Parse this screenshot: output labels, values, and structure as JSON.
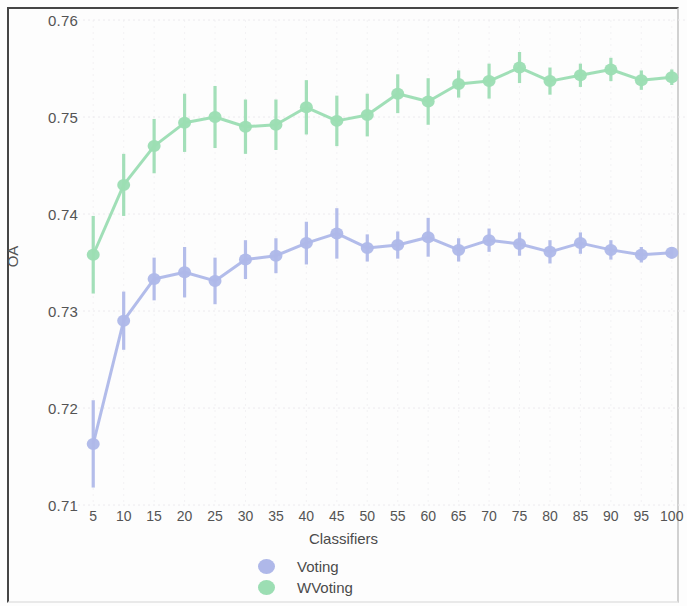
{
  "chart_data": {
    "type": "line",
    "title": "",
    "xlabel": "Classifiers",
    "ylabel": "OA",
    "x": [
      5,
      10,
      15,
      20,
      25,
      30,
      35,
      40,
      45,
      50,
      55,
      60,
      65,
      70,
      75,
      80,
      85,
      90,
      95,
      100
    ],
    "xtick_labels": [
      "5",
      "10",
      "15",
      "20",
      "25",
      "30",
      "35",
      "40",
      "45",
      "50",
      "55",
      "60",
      "65",
      "70",
      "75",
      "80",
      "85",
      "90",
      "95",
      "100"
    ],
    "ytick_labels": [
      "0.76",
      "0.75",
      "0.74",
      "0.73",
      "0.72",
      "0.71"
    ],
    "yticks": [
      0.76,
      0.75,
      0.74,
      0.73,
      0.72,
      0.71
    ],
    "xlim": [
      2.5,
      102.5
    ],
    "ylim": [
      0.71,
      0.76
    ],
    "grid": true,
    "legend_position": "bottom-center",
    "error_bars": true,
    "series": [
      {
        "name": "Voting",
        "color": "#aab4e8",
        "values": [
          0.7163,
          0.729,
          0.7333,
          0.734,
          0.7331,
          0.7353,
          0.7357,
          0.737,
          0.738,
          0.7365,
          0.7368,
          0.7376,
          0.7363,
          0.7373,
          0.7369,
          0.7361,
          0.737,
          0.7363,
          0.7358,
          0.736
        ],
        "errors": [
          0.0045,
          0.003,
          0.0022,
          0.0026,
          0.0024,
          0.002,
          0.0018,
          0.0022,
          0.0026,
          0.0014,
          0.0014,
          0.002,
          0.0012,
          0.0012,
          0.0012,
          0.0012,
          0.0011,
          0.001,
          0.0008,
          0.0006
        ]
      },
      {
        "name": "WVoting",
        "color": "#96dcaf",
        "values": [
          0.7358,
          0.743,
          0.747,
          0.7494,
          0.75,
          0.749,
          0.7492,
          0.751,
          0.7496,
          0.7502,
          0.7524,
          0.7516,
          0.7534,
          0.7537,
          0.7551,
          0.7537,
          0.7543,
          0.7549,
          0.7538,
          0.7541
        ]
      }
    ]
  },
  "chart_errors_wvoting": [
    0.004,
    0.0032,
    0.0028,
    0.003,
    0.0032,
    0.0028,
    0.0026,
    0.0028,
    0.0026,
    0.0022,
    0.002,
    0.0024,
    0.0014,
    0.0018,
    0.0016,
    0.0014,
    0.0012,
    0.0012,
    0.001,
    0.0008
  ],
  "legend": {
    "items": [
      {
        "label": "Voting",
        "color": "#aab4e8",
        "marker": "circle-marker"
      },
      {
        "label": "WVoting",
        "color": "#96dcaf",
        "marker": "circle-marker"
      }
    ]
  },
  "axes": {
    "y_axis_title": "OA",
    "x_axis_title": "Classifiers"
  },
  "colors": {
    "voting": "#aab4e8",
    "wvoting": "#96dcaf",
    "grid": "#eceaee",
    "text": "#4a4a4a",
    "frame": "#3a3a3a",
    "background": "#fdfdfd"
  }
}
